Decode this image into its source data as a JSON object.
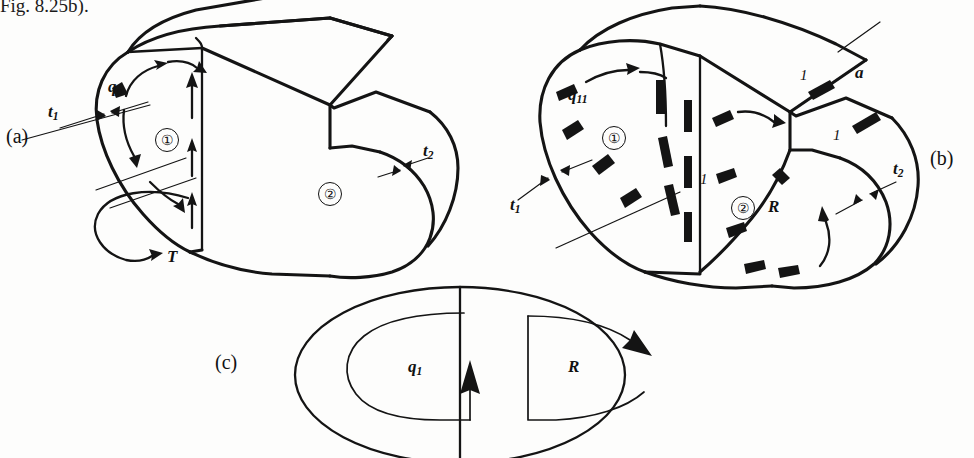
{
  "figure": {
    "top_note": "Fig. 8.25b).",
    "background": "#fdfdfc",
    "ink_color": "#141414"
  },
  "panel_a": {
    "caption": "(a)",
    "shear_flow_label": "q",
    "shear_flow_sub": "o",
    "thickness_1_label": "t",
    "thickness_1_sub": "1",
    "thickness_2_label": "t",
    "thickness_2_sub": "2",
    "cell_1": "①",
    "cell_2": "②",
    "torque_label": "T"
  },
  "panel_b": {
    "caption": "(b)",
    "shear_flow_label": "q",
    "shear_flow_sub": "11",
    "thickness_1_label": "t",
    "thickness_1_sub": "1",
    "thickness_2_label": "t",
    "thickness_2_sub": "2",
    "cell_1": "①",
    "cell_2": "②",
    "redundant_label": "R",
    "cut_label": "a",
    "unit_labels": [
      "1",
      "1",
      "1"
    ]
  },
  "panel_c": {
    "caption": "(c)",
    "left_loop_label": "q",
    "left_loop_sub": "1",
    "right_loop_label": "R"
  }
}
